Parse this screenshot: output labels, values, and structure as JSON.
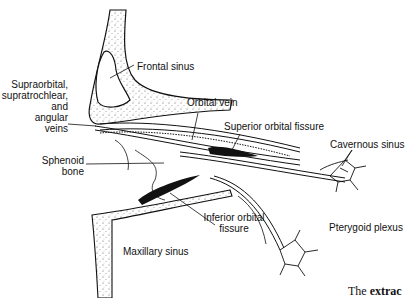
{
  "figure": {
    "labels": {
      "frontal_sinus": "Frontal sinus",
      "supraorbital_veins": [
        "Supraorbital,",
        "supratrochlear,",
        "and",
        "angular",
        "veins"
      ],
      "orbital_vein": "Orbital vein",
      "superior_orbital_fissure": "Superior orbital fissure",
      "cavernous_sinus": "Cavernous sinus",
      "sphenoid_bone": [
        "Sphenoid",
        "bone"
      ],
      "inferior_orbital_fissure": [
        "Inferior orbital",
        "fissure"
      ],
      "pterygoid_plexus": "Pterygoid plexus",
      "maxillary_sinus": "Maxillary sinus"
    },
    "caption": {
      "prefix": "The",
      "bold": "extrac"
    }
  }
}
